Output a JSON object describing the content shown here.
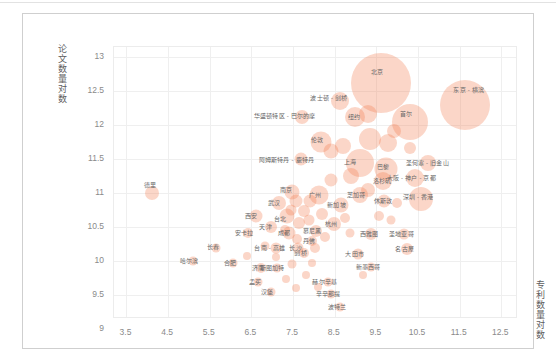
{
  "chart_data": {
    "type": "scatter",
    "title": "",
    "xlabel": "专利数量对数",
    "ylabel": "论文数量对数",
    "xlim": [
      3.2,
      12.9
    ],
    "ylim": [
      9.15,
      13.15
    ],
    "xticks": [
      "3.5",
      "4.5",
      "5.5",
      "6.5",
      "7.5",
      "8.5",
      "9.5",
      "10.5",
      "11.5",
      "12.5"
    ],
    "yticks": [
      "13",
      "12.5",
      "12",
      "11.5",
      "11",
      "10.5",
      "10",
      "9.5",
      "9"
    ],
    "grid": true,
    "legend": "none",
    "bubble_color": "#f2774a",
    "bubble_opacity": 0.3,
    "size_encoding": "bubble area encodes total output",
    "points": [
      {
        "label": "北京",
        "x": 9.62,
        "y": 12.62,
        "r": 30.0,
        "lx": 9.52,
        "ly": 12.78
      },
      {
        "label": "东京 - 横滨",
        "x": 11.62,
        "y": 12.3,
        "r": 25.0,
        "lx": 11.72,
        "ly": 12.52
      },
      {
        "label": "首尔",
        "x": 10.3,
        "y": 12.04,
        "r": 18.0,
        "lx": 10.22,
        "ly": 12.17
      },
      {
        "label": "波士顿 - 剑桥",
        "x": 8.62,
        "y": 12.36,
        "r": 9.0,
        "lx": 8.36,
        "ly": 12.4
      },
      {
        "label": "华盛顿特区 - 巴尔的摩",
        "x": 7.72,
        "y": 12.12,
        "r": 7.0,
        "lx": 7.3,
        "ly": 12.14
      },
      {
        "label": "纽约",
        "x": 8.98,
        "y": 12.12,
        "r": 10.0,
        "lx": 8.96,
        "ly": 12.12
      },
      {
        "label": "伦敦",
        "x": 8.16,
        "y": 11.76,
        "r": 10.5,
        "lx": 8.08,
        "ly": 11.78
      },
      {
        "label": "阿姆斯特丹 - 鹿特丹",
        "x": 7.7,
        "y": 11.5,
        "r": 6.5,
        "lx": 7.34,
        "ly": 11.49
      },
      {
        "label": "上海",
        "x": 9.1,
        "y": 11.44,
        "r": 14.0,
        "lx": 8.86,
        "ly": 11.46
      },
      {
        "label": "巴黎",
        "x": 9.72,
        "y": 11.36,
        "r": 11.5,
        "lx": 9.66,
        "ly": 11.38
      },
      {
        "label": "圣何塞 - 旧金山",
        "x": 10.74,
        "y": 11.44,
        "r": 8.0,
        "lx": 10.72,
        "ly": 11.44
      },
      {
        "label": "大阪 - 神户 - 京都",
        "x": 10.42,
        "y": 11.22,
        "r": 9.0,
        "lx": 10.34,
        "ly": 11.22
      },
      {
        "label": "深圳 - 香港",
        "x": 10.56,
        "y": 10.92,
        "r": 12.0,
        "lx": 10.5,
        "ly": 10.94
      },
      {
        "label": "洛杉矶",
        "x": 9.66,
        "y": 11.18,
        "r": 9.0,
        "lx": 9.64,
        "ly": 11.18
      },
      {
        "label": "芝加哥",
        "x": 9.1,
        "y": 10.98,
        "r": 8.0,
        "lx": 9.02,
        "ly": 10.98
      },
      {
        "label": "休斯敦",
        "x": 9.68,
        "y": 10.88,
        "r": 6.5,
        "lx": 9.66,
        "ly": 10.88
      },
      {
        "label": "南京",
        "x": 7.48,
        "y": 11.02,
        "r": 7.5,
        "lx": 7.34,
        "ly": 11.04
      },
      {
        "label": "广州",
        "x": 8.12,
        "y": 10.98,
        "r": 9.5,
        "lx": 8.02,
        "ly": 10.97
      },
      {
        "label": "武汉",
        "x": 7.16,
        "y": 10.86,
        "r": 7.0,
        "lx": 7.04,
        "ly": 10.86
      },
      {
        "label": "西安",
        "x": 6.6,
        "y": 10.66,
        "r": 6.5,
        "lx": 6.5,
        "ly": 10.66
      },
      {
        "label": "天津",
        "x": 6.96,
        "y": 10.5,
        "r": 6.0,
        "lx": 6.84,
        "ly": 10.5
      },
      {
        "label": "台北",
        "x": 7.36,
        "y": 10.66,
        "r": 7.5,
        "lx": 7.18,
        "ly": 10.62
      },
      {
        "label": "新加坡",
        "x": 8.64,
        "y": 10.82,
        "r": 7.5,
        "lx": 8.54,
        "ly": 10.82
      },
      {
        "label": "杭州",
        "x": 8.48,
        "y": 10.54,
        "r": 7.0,
        "lx": 8.42,
        "ly": 10.54
      },
      {
        "label": "成都",
        "x": 7.4,
        "y": 10.42,
        "r": 6.5,
        "lx": 7.28,
        "ly": 10.42
      },
      {
        "label": "安卡拉",
        "x": 6.42,
        "y": 10.42,
        "r": 5.0,
        "lx": 6.32,
        "ly": 10.42
      },
      {
        "label": "长春",
        "x": 5.66,
        "y": 10.2,
        "r": 4.5,
        "lx": 5.58,
        "ly": 10.21
      },
      {
        "label": "哈尔滨",
        "x": 5.1,
        "y": 10.0,
        "r": 4.5,
        "lx": 5.0,
        "ly": 10.0
      },
      {
        "label": "台南 - 高雄",
        "x": 7.1,
        "y": 10.2,
        "r": 5.5,
        "lx": 6.94,
        "ly": 10.2
      },
      {
        "label": "长沙",
        "x": 7.62,
        "y": 10.2,
        "r": 5.5,
        "lx": 7.56,
        "ly": 10.2
      },
      {
        "label": "合肥",
        "x": 6.06,
        "y": 9.98,
        "r": 4.5,
        "lx": 5.98,
        "ly": 9.98
      },
      {
        "label": "济南",
        "x": 6.74,
        "y": 9.9,
        "r": 5.0,
        "lx": 6.66,
        "ly": 9.9
      },
      {
        "label": "慕尼黑",
        "x": 8.06,
        "y": 10.44,
        "r": 6.0,
        "lx": 7.96,
        "ly": 10.44
      },
      {
        "label": "丹佛",
        "x": 7.96,
        "y": 10.3,
        "r": 5.0,
        "lx": 7.88,
        "ly": 10.3
      },
      {
        "label": "剑桥",
        "x": 7.76,
        "y": 10.12,
        "r": 5.0,
        "lx": 7.68,
        "ly": 10.12
      },
      {
        "label": "西雅图",
        "x": 9.38,
        "y": 10.4,
        "r": 6.0,
        "lx": 9.32,
        "ly": 10.4
      },
      {
        "label": "大田市",
        "x": 9.06,
        "y": 10.1,
        "r": 5.5,
        "lx": 8.98,
        "ly": 10.1
      },
      {
        "label": "圣地亚哥",
        "x": 10.16,
        "y": 10.4,
        "r": 5.5,
        "lx": 10.1,
        "ly": 10.4
      },
      {
        "label": "名古屋",
        "x": 10.24,
        "y": 10.18,
        "r": 6.0,
        "lx": 10.18,
        "ly": 10.18
      },
      {
        "label": "斯图加特",
        "x": 7.12,
        "y": 9.9,
        "r": 4.5,
        "lx": 7.0,
        "ly": 9.9
      },
      {
        "label": "孟买",
        "x": 6.66,
        "y": 9.7,
        "r": 4.5,
        "lx": 6.58,
        "ly": 9.7
      },
      {
        "label": "汉堡",
        "x": 6.96,
        "y": 9.54,
        "r": 4.5,
        "lx": 6.88,
        "ly": 9.54
      },
      {
        "label": "赫尔辛基",
        "x": 8.34,
        "y": 9.7,
        "r": 4.5,
        "lx": 8.26,
        "ly": 9.7
      },
      {
        "label": "辛辛那提",
        "x": 8.4,
        "y": 9.52,
        "r": 4.5,
        "lx": 8.34,
        "ly": 9.52
      },
      {
        "label": "新墨西哥",
        "x": 9.38,
        "y": 9.92,
        "r": 4.5,
        "lx": 9.3,
        "ly": 9.92
      },
      {
        "label": "波特兰",
        "x": 8.62,
        "y": 9.32,
        "r": 4.5,
        "lx": 8.56,
        "ly": 9.32
      },
      {
        "label": "德里",
        "x": 4.12,
        "y": 11.0,
        "r": 7.0,
        "lx": 4.06,
        "ly": 11.12
      }
    ],
    "extra_bubbles": [
      {
        "x": 9.3,
        "y": 12.16,
        "r": 9.0
      },
      {
        "x": 9.34,
        "y": 11.8,
        "r": 11.0
      },
      {
        "x": 9.78,
        "y": 11.74,
        "r": 9.0
      },
      {
        "x": 8.7,
        "y": 11.7,
        "r": 8.0
      },
      {
        "x": 8.42,
        "y": 11.62,
        "r": 7.5
      },
      {
        "x": 9.92,
        "y": 11.92,
        "r": 7.0
      },
      {
        "x": 10.3,
        "y": 11.66,
        "r": 6.0
      },
      {
        "x": 8.9,
        "y": 11.26,
        "r": 8.0
      },
      {
        "x": 8.4,
        "y": 11.2,
        "r": 6.5
      },
      {
        "x": 9.3,
        "y": 11.04,
        "r": 7.0
      },
      {
        "x": 8.2,
        "y": 10.7,
        "r": 6.0
      },
      {
        "x": 7.9,
        "y": 10.88,
        "r": 6.5
      },
      {
        "x": 7.76,
        "y": 10.74,
        "r": 6.0
      },
      {
        "x": 7.58,
        "y": 10.88,
        "r": 6.5
      },
      {
        "x": 7.64,
        "y": 10.56,
        "r": 6.0
      },
      {
        "x": 7.88,
        "y": 10.6,
        "r": 5.5
      },
      {
        "x": 8.02,
        "y": 10.2,
        "r": 5.0
      },
      {
        "x": 8.26,
        "y": 10.36,
        "r": 5.0
      },
      {
        "x": 7.46,
        "y": 10.76,
        "r": 5.5
      },
      {
        "x": 7.3,
        "y": 10.46,
        "r": 5.0
      },
      {
        "x": 7.6,
        "y": 10.32,
        "r": 5.0
      },
      {
        "x": 7.48,
        "y": 9.96,
        "r": 4.5
      },
      {
        "x": 7.82,
        "y": 9.8,
        "r": 4.0
      },
      {
        "x": 7.1,
        "y": 10.06,
        "r": 4.0
      },
      {
        "x": 8.74,
        "y": 10.64,
        "r": 5.0
      },
      {
        "x": 8.86,
        "y": 10.42,
        "r": 4.5
      },
      {
        "x": 9.56,
        "y": 10.66,
        "r": 5.0
      },
      {
        "x": 9.86,
        "y": 10.6,
        "r": 4.5
      },
      {
        "x": 10.0,
        "y": 10.86,
        "r": 5.0
      },
      {
        "x": 6.82,
        "y": 10.22,
        "r": 4.5
      },
      {
        "x": 6.4,
        "y": 10.08,
        "r": 4.0
      },
      {
        "x": 7.96,
        "y": 9.98,
        "r": 4.0
      },
      {
        "x": 8.1,
        "y": 9.62,
        "r": 4.0
      },
      {
        "x": 9.18,
        "y": 9.8,
        "r": 4.0
      },
      {
        "x": 7.34,
        "y": 9.74,
        "r": 4.0
      },
      {
        "x": 7.58,
        "y": 9.6,
        "r": 4.0
      }
    ]
  }
}
